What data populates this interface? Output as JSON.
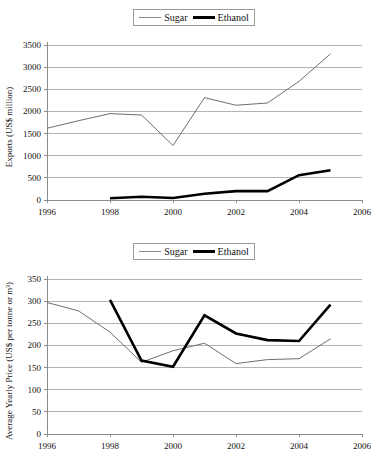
{
  "charts": [
    {
      "id": "exports-chart",
      "ylabel": "Exports (US$ million)",
      "legend": [
        {
          "label": "Sugar",
          "style": "thin-gray"
        },
        {
          "label": "Ethanol",
          "style": "thick-black"
        }
      ],
      "yticks": [
        "0",
        "500",
        "1000",
        "1500",
        "2000",
        "2500",
        "3000",
        "3500"
      ],
      "xticks": [
        "1996",
        "1998",
        "2000",
        "2002",
        "2004",
        "2006"
      ]
    },
    {
      "id": "price-chart",
      "ylabel": "Average Yearly Price (US$ per tonne or m³)",
      "legend": [
        {
          "label": "Sugar",
          "style": "thin-gray"
        },
        {
          "label": "Ethanol",
          "style": "thick-black"
        }
      ],
      "yticks": [
        "0",
        "50",
        "100",
        "150",
        "200",
        "250",
        "300",
        "350"
      ],
      "xticks": [
        "1996",
        "1998",
        "2000",
        "2002",
        "2004",
        "2006"
      ]
    }
  ],
  "chart_data": [
    {
      "type": "line",
      "title": "",
      "xlabel": "",
      "ylabel": "Exports (US$ million)",
      "xlim": [
        1996,
        2006
      ],
      "ylim": [
        0,
        3500
      ],
      "ytick_step": 500,
      "xtick_step": 2,
      "grid": true,
      "legend_position": "top-center",
      "series": [
        {
          "name": "Sugar",
          "color": "#6e6e6e",
          "width": "thin",
          "x": [
            1996,
            1997,
            1998,
            1999,
            2000,
            2001,
            2002,
            2003,
            2004,
            2005
          ],
          "values": [
            1620,
            1790,
            1950,
            1920,
            1230,
            2310,
            2140,
            2190,
            2680,
            3300
          ]
        },
        {
          "name": "Ethanol",
          "color": "#000000",
          "width": "thick",
          "x": [
            1998,
            1999,
            2000,
            2001,
            2002,
            2003,
            2004,
            2005
          ],
          "values": [
            40,
            75,
            45,
            140,
            200,
            200,
            560,
            670
          ]
        }
      ]
    },
    {
      "type": "line",
      "title": "",
      "xlabel": "",
      "ylabel": "Average Yearly Price (US$ per tonne or m³)",
      "xlim": [
        1996,
        2006
      ],
      "ylim": [
        0,
        350
      ],
      "ytick_step": 50,
      "xtick_step": 2,
      "grid": true,
      "legend_position": "top-center",
      "series": [
        {
          "name": "Sugar",
          "color": "#6e6e6e",
          "width": "thin",
          "x": [
            1996,
            1997,
            1998,
            1999,
            2000,
            2001,
            2002,
            2003,
            2004,
            2005
          ],
          "values": [
            297,
            278,
            230,
            162,
            188,
            205,
            159,
            168,
            170,
            215
          ]
        },
        {
          "name": "Ethanol",
          "color": "#000000",
          "width": "thick",
          "x": [
            1998,
            1999,
            2000,
            2001,
            2002,
            2003,
            2004,
            2005
          ],
          "values": [
            303,
            166,
            152,
            268,
            227,
            212,
            210,
            292
          ]
        }
      ]
    }
  ]
}
